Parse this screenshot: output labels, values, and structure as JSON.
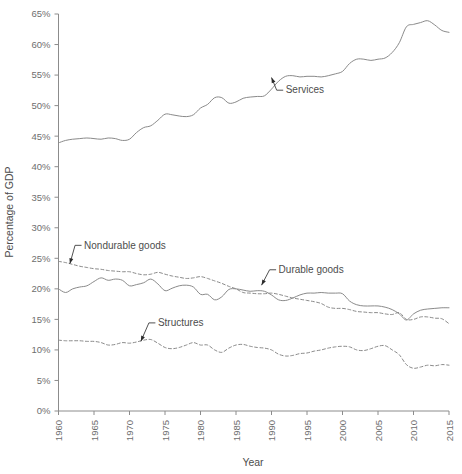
{
  "chart_data": {
    "type": "line",
    "title": "",
    "xlabel": "Year",
    "ylabel": "Percentage of GDP",
    "xlim": [
      1960,
      2015
    ],
    "ylim": [
      0,
      65
    ],
    "grid": false,
    "legend_position": "inline-annotations",
    "xticks": [
      "1960",
      "1965",
      "1970",
      "1975",
      "1980",
      "1985",
      "1990",
      "1995",
      "2000",
      "2005",
      "2010",
      "2015"
    ],
    "yticks": [
      "0%",
      "5%",
      "10%",
      "15%",
      "20%",
      "25%",
      "30%",
      "35%",
      "40%",
      "45%",
      "50%",
      "55%",
      "60%",
      "65%"
    ],
    "ytick_values": [
      0,
      5,
      10,
      15,
      20,
      25,
      30,
      35,
      40,
      45,
      50,
      55,
      60,
      65
    ],
    "xtick_values": [
      1960,
      1965,
      1970,
      1975,
      1980,
      1985,
      1990,
      1995,
      2000,
      2005,
      2010,
      2015
    ],
    "annotations": [
      {
        "text": "Services",
        "x": 1992.0,
        "y": 52.0,
        "point_x": 1990.0,
        "point_y": 54.6
      },
      {
        "text": "Nondurable goods",
        "x": 1963.6,
        "y": 26.6,
        "point_x": 1961.6,
        "point_y": 24.1
      },
      {
        "text": "Durable goods",
        "x": 1991.0,
        "y": 22.6,
        "point_x": 1988.6,
        "point_y": 20.6
      },
      {
        "text": "Structures",
        "x": 1974.0,
        "y": 13.9,
        "point_x": 1971.6,
        "point_y": 11.4
      }
    ],
    "series": [
      {
        "name": "Services",
        "style": "solid",
        "color": "#8a8a8a",
        "x": [
          1960,
          1961,
          1962,
          1963,
          1964,
          1965,
          1966,
          1967,
          1968,
          1969,
          1970,
          1971,
          1972,
          1973,
          1974,
          1975,
          1976,
          1977,
          1978,
          1979,
          1980,
          1981,
          1982,
          1983,
          1984,
          1985,
          1986,
          1987,
          1988,
          1989,
          1990,
          1991,
          1992,
          1993,
          1994,
          1995,
          1996,
          1997,
          1998,
          1999,
          2000,
          2001,
          2002,
          2003,
          2004,
          2005,
          2006,
          2007,
          2008,
          2009,
          2010,
          2011,
          2012,
          2013,
          2014,
          2015
        ],
        "values": [
          43.9,
          44.3,
          44.5,
          44.6,
          44.7,
          44.6,
          44.5,
          44.7,
          44.6,
          44.3,
          44.5,
          45.6,
          46.4,
          46.7,
          47.6,
          48.6,
          48.5,
          48.3,
          48.2,
          48.5,
          49.6,
          50.2,
          51.3,
          51.3,
          50.4,
          50.6,
          51.2,
          51.4,
          51.5,
          51.6,
          52.7,
          54.0,
          54.8,
          54.9,
          54.7,
          54.8,
          54.8,
          54.7,
          54.9,
          55.2,
          55.6,
          56.9,
          57.6,
          57.6,
          57.4,
          57.6,
          57.8,
          58.7,
          60.3,
          62.9,
          63.3,
          63.6,
          63.9,
          63.2,
          62.3,
          62.0
        ]
      },
      {
        "name": "Nondurable goods",
        "style": "dashed",
        "color": "#8a8a8a",
        "x": [
          1960,
          1961,
          1962,
          1963,
          1964,
          1965,
          1966,
          1967,
          1968,
          1969,
          1970,
          1971,
          1972,
          1973,
          1974,
          1975,
          1976,
          1977,
          1978,
          1979,
          1980,
          1981,
          1982,
          1983,
          1984,
          1985,
          1986,
          1987,
          1988,
          1989,
          1990,
          1991,
          1992,
          1993,
          1994,
          1995,
          1996,
          1997,
          1998,
          1999,
          2000,
          2001,
          2002,
          2003,
          2004,
          2005,
          2006,
          2007,
          2008,
          2009,
          2010,
          2011,
          2012,
          2013,
          2014,
          2015
        ],
        "values": [
          24.5,
          24.3,
          24.0,
          23.7,
          23.5,
          23.3,
          23.2,
          23.0,
          22.9,
          22.8,
          22.8,
          22.5,
          22.3,
          22.4,
          22.7,
          22.4,
          22.1,
          21.9,
          21.7,
          21.8,
          22.0,
          21.7,
          21.3,
          20.9,
          20.4,
          20.0,
          19.4,
          19.3,
          19.2,
          19.2,
          19.3,
          19.1,
          18.8,
          18.5,
          18.3,
          18.1,
          17.9,
          17.6,
          17.0,
          16.8,
          16.8,
          16.6,
          16.3,
          16.2,
          16.1,
          16.1,
          15.9,
          15.8,
          16.1,
          15.0,
          15.0,
          15.4,
          15.4,
          15.2,
          15.1,
          14.3
        ]
      },
      {
        "name": "Durable goods",
        "style": "solid",
        "color": "#8a8a8a",
        "x": [
          1960,
          1961,
          1962,
          1963,
          1964,
          1965,
          1966,
          1967,
          1968,
          1969,
          1970,
          1971,
          1972,
          1973,
          1974,
          1975,
          1976,
          1977,
          1978,
          1979,
          1980,
          1981,
          1982,
          1983,
          1984,
          1985,
          1986,
          1987,
          1988,
          1989,
          1990,
          1991,
          1992,
          1993,
          1994,
          1995,
          1996,
          1997,
          1998,
          1999,
          2000,
          2001,
          2002,
          2003,
          2004,
          2005,
          2006,
          2007,
          2008,
          2009,
          2010,
          2011,
          2012,
          2013,
          2014,
          2015
        ],
        "values": [
          20.0,
          19.4,
          20.0,
          20.3,
          20.5,
          21.2,
          21.8,
          21.4,
          21.6,
          21.4,
          20.5,
          20.7,
          21.0,
          21.6,
          20.8,
          19.7,
          20.1,
          20.5,
          20.6,
          20.3,
          19.1,
          19.1,
          18.2,
          18.7,
          19.9,
          20.0,
          19.8,
          19.6,
          19.7,
          19.6,
          19.0,
          18.2,
          18.1,
          18.5,
          19.0,
          19.3,
          19.3,
          19.4,
          19.3,
          19.3,
          19.2,
          18.0,
          17.4,
          17.2,
          17.2,
          17.2,
          17.0,
          16.6,
          15.9,
          14.9,
          15.9,
          16.5,
          16.7,
          16.8,
          16.9,
          16.9
        ]
      },
      {
        "name": "Structures",
        "style": "dashed",
        "color": "#8a8a8a",
        "x": [
          1960,
          1961,
          1962,
          1963,
          1964,
          1965,
          1966,
          1967,
          1968,
          1969,
          1970,
          1971,
          1972,
          1973,
          1974,
          1975,
          1976,
          1977,
          1978,
          1979,
          1980,
          1981,
          1982,
          1983,
          1984,
          1985,
          1986,
          1987,
          1988,
          1989,
          1990,
          1991,
          1992,
          1993,
          1994,
          1995,
          1996,
          1997,
          1998,
          1999,
          2000,
          2001,
          2002,
          2003,
          2004,
          2005,
          2006,
          2007,
          2008,
          2009,
          2010,
          2011,
          2012,
          2013,
          2014,
          2015
        ],
        "values": [
          11.6,
          11.5,
          11.5,
          11.5,
          11.4,
          11.4,
          11.2,
          10.8,
          10.9,
          11.2,
          11.1,
          11.3,
          11.6,
          11.7,
          11.1,
          10.4,
          10.2,
          10.4,
          10.8,
          11.2,
          10.8,
          10.8,
          10.0,
          9.6,
          10.3,
          10.8,
          10.9,
          10.6,
          10.4,
          10.3,
          10.0,
          9.3,
          9.0,
          9.1,
          9.4,
          9.5,
          9.8,
          10.0,
          10.3,
          10.5,
          10.6,
          10.5,
          10.0,
          9.9,
          10.2,
          10.6,
          10.7,
          10.0,
          9.2,
          7.6,
          7.0,
          7.2,
          7.5,
          7.4,
          7.6,
          7.5
        ]
      }
    ]
  }
}
